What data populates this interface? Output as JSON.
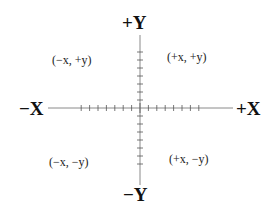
{
  "diagram": {
    "type": "cartesian-coordinate-plane",
    "axes": {
      "x_positive": "+X",
      "x_negative": "−X",
      "y_positive": "+Y",
      "y_negative": "−Y"
    },
    "quadrants": {
      "q1": "(+x, +y)",
      "q2": "(−x, +y)",
      "q3": "(−x, −y)",
      "q4": "(+x, −y)"
    },
    "ticks_per_half_axis": 7,
    "colors": {
      "background": "#ffffff",
      "axis_line": "#888888",
      "tick": "#555555",
      "text": "#111111"
    }
  }
}
